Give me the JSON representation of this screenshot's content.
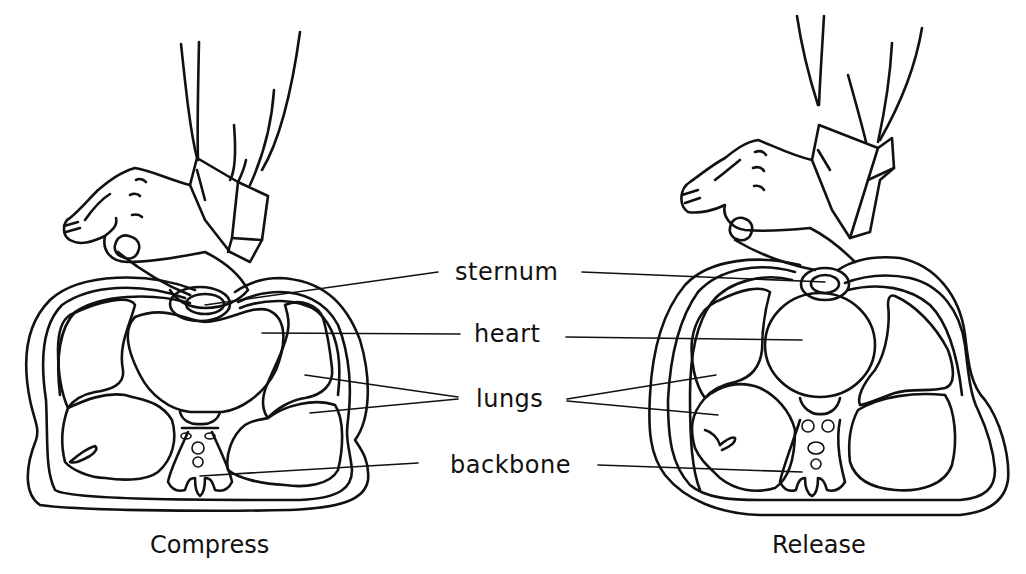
{
  "diagram": {
    "type": "cpr-chest-compression-cross-section",
    "labels": {
      "sternum": "sternum",
      "heart": "heart",
      "lungs": "lungs",
      "backbone": "backbone"
    },
    "panels": [
      {
        "id": "left",
        "caption": "Compress"
      },
      {
        "id": "right",
        "caption": "Release"
      }
    ],
    "colors": {
      "ink": "#111111",
      "background": "#ffffff"
    }
  }
}
